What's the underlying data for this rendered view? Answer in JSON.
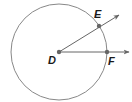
{
  "diagram": {
    "stroke_color": "#777777",
    "point_color": "#666666",
    "label_color": "#1a1a1a",
    "circle": {
      "cx": 59,
      "cy": 52,
      "r": 48
    },
    "points": [
      {
        "id": "D",
        "label": "D",
        "x": 59,
        "y": 52,
        "label_x": 48,
        "label_y": 64
      },
      {
        "id": "E",
        "label": "E",
        "x": 99,
        "y": 26,
        "label_x": 94,
        "label_y": 18
      },
      {
        "id": "F",
        "label": "F",
        "x": 107,
        "y": 52,
        "label_x": 108,
        "label_y": 65
      }
    ],
    "rays": [
      {
        "id": "ray-DE",
        "from": "D",
        "through": "E",
        "end_x": 119,
        "end_y": 15
      },
      {
        "id": "ray-DF",
        "from": "D",
        "through": "F",
        "end_x": 129,
        "end_y": 52
      }
    ]
  }
}
